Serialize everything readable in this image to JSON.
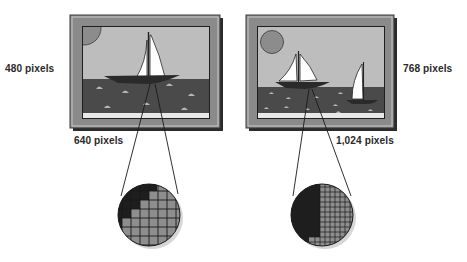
{
  "diagram": {
    "topic": "Screen resolution comparison",
    "panels": [
      {
        "id": "low-res",
        "width_label": "640 pixels",
        "height_label": "480 pixels",
        "magnifier_grid": "coarse",
        "boats": 1
      },
      {
        "id": "high-res",
        "width_label": "1,024 pixels",
        "height_label": "768 pixels",
        "magnifier_grid": "fine",
        "boats": 2
      }
    ],
    "colors": {
      "frame_outer": "#8a8a8a",
      "frame_edge": "#3a3a3a",
      "sky": "#bdbdbd",
      "sun": "#8c8c8c",
      "water": "#4a4a4a",
      "wave": "#b5b5b5",
      "sail": "#ffffff",
      "hull": "#2a2a2a",
      "pixel_dark": "#1e1e1e",
      "pixel_light": "#8e8e8e"
    }
  }
}
